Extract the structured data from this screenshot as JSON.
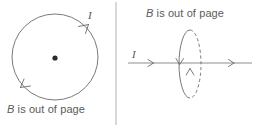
{
  "figure": {
    "width": 255,
    "height": 127,
    "background": "#ffffff",
    "stroke_color": "#6b6b6b",
    "text_color": "#5a5a5a",
    "divider_color": "#b8b8b8"
  },
  "left_panel": {
    "name": "circular-loop-face-on-view",
    "caption": {
      "symbol": "B",
      "text": " is out of page",
      "full": "B is out of page"
    },
    "current_label": "I",
    "loop": {
      "shape": "circle",
      "center_x": 55,
      "center_y": 57,
      "radius": 43
    },
    "field_marker": {
      "type": "dot-out-of-page",
      "x": 55,
      "y": 58,
      "radius": 2.6
    },
    "direction": "counterclockwise",
    "arrowheads": 2
  },
  "right_panel": {
    "name": "circular-loop-edge-on-view",
    "caption": {
      "symbol": "B",
      "text": " is out of page",
      "full": "B is out of page"
    },
    "current_label": "I",
    "axis_line": {
      "y": 63,
      "x_start": 128,
      "x_end": 252,
      "arrow_positions": [
        152,
        233
      ]
    },
    "loop": {
      "shape": "ellipse",
      "center_x": 190,
      "center_y": 64,
      "rx": 11,
      "ry": 34,
      "near_half": "solid",
      "far_half": "dashed"
    },
    "arrowheads": 2
  },
  "divider": {
    "x": 116,
    "y_start": 2,
    "y_end": 125
  }
}
